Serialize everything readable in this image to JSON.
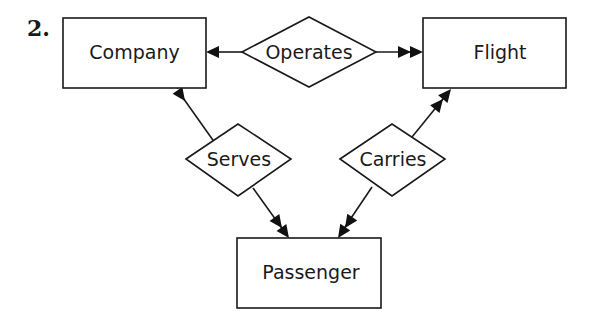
{
  "figure_number": "2.",
  "colors": {
    "ink": "#1a1a1a",
    "background": "#ffffff"
  },
  "entities": [
    {
      "id": "company",
      "label": "Company"
    },
    {
      "id": "flight",
      "label": "Flight"
    },
    {
      "id": "passenger",
      "label": "Passenger"
    }
  ],
  "relationships": [
    {
      "id": "operates",
      "label": "Operates"
    },
    {
      "id": "serves",
      "label": "Serves"
    },
    {
      "id": "carries",
      "label": "Carries"
    }
  ],
  "edges": [
    {
      "from": "operates",
      "to": "company",
      "arrowhead": "single"
    },
    {
      "from": "operates",
      "to": "flight",
      "arrowhead": "double"
    },
    {
      "from": "serves",
      "to": "company",
      "arrowhead": "double"
    },
    {
      "from": "serves",
      "to": "passenger",
      "arrowhead": "double"
    },
    {
      "from": "carries",
      "to": "flight",
      "arrowhead": "double"
    },
    {
      "from": "carries",
      "to": "passenger",
      "arrowhead": "double"
    }
  ]
}
